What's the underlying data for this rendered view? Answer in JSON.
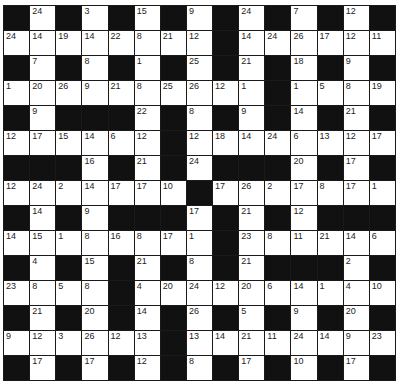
{
  "puzzle": {
    "type": "codeword",
    "rows": 15,
    "cols": 15,
    "colors": {
      "block": "#111111",
      "cell": "#ffffff",
      "text": "#222222"
    },
    "grid": [
      [
        null,
        24,
        null,
        3,
        null,
        15,
        null,
        9,
        null,
        24,
        null,
        7,
        null,
        12,
        null
      ],
      [
        24,
        14,
        19,
        14,
        22,
        8,
        21,
        12,
        null,
        14,
        24,
        26,
        17,
        12,
        11
      ],
      [
        null,
        7,
        null,
        8,
        null,
        1,
        null,
        25,
        null,
        21,
        null,
        18,
        null,
        9,
        null
      ],
      [
        1,
        20,
        26,
        9,
        21,
        8,
        25,
        26,
        12,
        1,
        null,
        1,
        5,
        8,
        19
      ],
      [
        null,
        9,
        null,
        null,
        null,
        22,
        null,
        8,
        null,
        9,
        null,
        14,
        null,
        21,
        null
      ],
      [
        12,
        17,
        15,
        14,
        6,
        12,
        null,
        12,
        18,
        14,
        24,
        6,
        13,
        12,
        17
      ],
      [
        null,
        null,
        null,
        16,
        null,
        21,
        null,
        24,
        null,
        null,
        null,
        20,
        null,
        17,
        null
      ],
      [
        12,
        24,
        2,
        14,
        17,
        17,
        10,
        null,
        17,
        26,
        2,
        17,
        8,
        17,
        1
      ],
      [
        null,
        14,
        null,
        9,
        null,
        null,
        null,
        17,
        null,
        21,
        null,
        12,
        null,
        null,
        null
      ],
      [
        14,
        15,
        1,
        8,
        16,
        8,
        17,
        1,
        null,
        23,
        8,
        11,
        21,
        14,
        6
      ],
      [
        null,
        4,
        null,
        15,
        null,
        21,
        null,
        8,
        null,
        21,
        null,
        null,
        null,
        2,
        null
      ],
      [
        23,
        8,
        5,
        8,
        null,
        4,
        20,
        24,
        12,
        20,
        6,
        14,
        1,
        4,
        10
      ],
      [
        null,
        21,
        null,
        20,
        null,
        14,
        null,
        26,
        null,
        5,
        null,
        9,
        null,
        20,
        null
      ],
      [
        9,
        12,
        3,
        26,
        12,
        13,
        null,
        13,
        14,
        21,
        11,
        24,
        14,
        9,
        23
      ],
      [
        null,
        17,
        null,
        17,
        null,
        12,
        null,
        8,
        null,
        17,
        null,
        10,
        null,
        17,
        null
      ]
    ]
  }
}
